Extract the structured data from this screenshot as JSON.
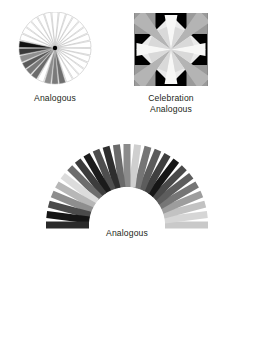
{
  "page": {
    "background": "#ffffff",
    "width": 254,
    "height": 339,
    "text_color": "#231f20"
  },
  "figures": [
    {
      "id": "color-wheel",
      "kind": "radial-wedge-wheel",
      "caption_lines": [
        "Analogous"
      ],
      "center": {
        "x": 37,
        "y": 36
      },
      "radius": 36,
      "hub_color": "#000000",
      "hub_radius": 2.2,
      "outline_color": "#b5b5b5",
      "wedge_count": 30,
      "wedges": [
        {
          "index": 0,
          "angle_deg": 0,
          "fill": "#ffffff"
        },
        {
          "index": 1,
          "angle_deg": 12,
          "fill": "#ffffff"
        },
        {
          "index": 2,
          "angle_deg": 24,
          "fill": "#ffffff"
        },
        {
          "index": 3,
          "angle_deg": 36,
          "fill": "#ffffff"
        },
        {
          "index": 4,
          "angle_deg": 48,
          "fill": "#ffffff"
        },
        {
          "index": 5,
          "angle_deg": 60,
          "fill": "#ffffff"
        },
        {
          "index": 6,
          "angle_deg": 72,
          "fill": "#ffffff"
        },
        {
          "index": 7,
          "angle_deg": 84,
          "fill": "#ffffff"
        },
        {
          "index": 8,
          "angle_deg": 96,
          "fill": "#ffffff"
        },
        {
          "index": 9,
          "angle_deg": 108,
          "fill": "#ffffff"
        },
        {
          "index": 10,
          "angle_deg": 120,
          "fill": "#ffffff"
        },
        {
          "index": 11,
          "angle_deg": 132,
          "fill": "#ffffff"
        },
        {
          "index": 12,
          "angle_deg": 144,
          "fill": "#ffffff"
        },
        {
          "index": 13,
          "angle_deg": 156,
          "fill": "#ffffff"
        },
        {
          "index": 14,
          "angle_deg": 168,
          "fill": "#6e6e6e"
        },
        {
          "index": 15,
          "angle_deg": 180,
          "fill": "#7a7a7a"
        },
        {
          "index": 16,
          "angle_deg": 192,
          "fill": "#8c8c8c"
        },
        {
          "index": 17,
          "angle_deg": 204,
          "fill": "#ffffff"
        },
        {
          "index": 18,
          "angle_deg": 216,
          "fill": "#6b6b6b"
        },
        {
          "index": 19,
          "angle_deg": 228,
          "fill": "#787878"
        },
        {
          "index": 20,
          "angle_deg": 240,
          "fill": "#5a5a5a"
        },
        {
          "index": 21,
          "angle_deg": 252,
          "fill": "#8f8f8f"
        },
        {
          "index": 22,
          "angle_deg": 264,
          "fill": "#3a3a3a"
        },
        {
          "index": 23,
          "angle_deg": 276,
          "fill": "#111111"
        },
        {
          "index": 24,
          "angle_deg": 288,
          "fill": "#ffffff"
        },
        {
          "index": 25,
          "angle_deg": 300,
          "fill": "#ffffff"
        },
        {
          "index": 26,
          "angle_deg": 312,
          "fill": "#ffffff"
        },
        {
          "index": 27,
          "angle_deg": 324,
          "fill": "#ffffff"
        },
        {
          "index": 28,
          "angle_deg": 336,
          "fill": "#ffffff"
        },
        {
          "index": 29,
          "angle_deg": 348,
          "fill": "#ffffff"
        }
      ]
    },
    {
      "id": "celebration-block",
      "kind": "quilt-star-block",
      "caption_lines": [
        "Celebration",
        "Analogous"
      ],
      "size": 74,
      "background": "#f0efee",
      "palette": {
        "corner_dark": "#9a9a9a",
        "mid_gray": "#b4b4b4",
        "light_gray": "#d9d9d9",
        "pale": "#eaeaea",
        "white": "#f7f7f6"
      }
    },
    {
      "id": "analogous-fan",
      "kind": "radial-bar-fan",
      "caption_lines": [
        "Analogous"
      ],
      "center": {
        "x": 109,
        "y": 87
      },
      "inner_radius": 38,
      "outer_radius": 81,
      "bar_width": 7.0,
      "bar_count": 25,
      "span_deg": 180,
      "bars": [
        {
          "index": 0,
          "angle_deg": 180,
          "fill": "#c9c9c9"
        },
        {
          "index": 1,
          "angle_deg": 172.5,
          "fill": "#d6d6d6"
        },
        {
          "index": 2,
          "angle_deg": 165,
          "fill": "#c2c2c2"
        },
        {
          "index": 3,
          "angle_deg": 157.5,
          "fill": "#9d9d9d"
        },
        {
          "index": 4,
          "angle_deg": 150,
          "fill": "#767676"
        },
        {
          "index": 5,
          "angle_deg": 142.5,
          "fill": "#5d5d5d"
        },
        {
          "index": 6,
          "angle_deg": 135,
          "fill": "#4a4a4a"
        },
        {
          "index": 7,
          "angle_deg": 127.5,
          "fill": "#161616"
        },
        {
          "index": 8,
          "angle_deg": 120,
          "fill": "#3f3f3f"
        },
        {
          "index": 9,
          "angle_deg": 112.5,
          "fill": "#5c5c5c"
        },
        {
          "index": 10,
          "angle_deg": 105,
          "fill": "#757575"
        },
        {
          "index": 11,
          "angle_deg": 97.5,
          "fill": "#cfcfcf"
        },
        {
          "index": 12,
          "angle_deg": 90,
          "fill": "#8b8b8b"
        },
        {
          "index": 13,
          "angle_deg": 82.5,
          "fill": "#6a6a6a"
        },
        {
          "index": 14,
          "angle_deg": 75,
          "fill": "#2e2e2e"
        },
        {
          "index": 15,
          "angle_deg": 67.5,
          "fill": "#4e4e4e"
        },
        {
          "index": 16,
          "angle_deg": 60,
          "fill": "#1b1b1b"
        },
        {
          "index": 17,
          "angle_deg": 52.5,
          "fill": "#3c3c3c"
        },
        {
          "index": 18,
          "angle_deg": 45,
          "fill": "#6d6d6d"
        },
        {
          "index": 19,
          "angle_deg": 37.5,
          "fill": "#dcdcdc"
        },
        {
          "index": 20,
          "angle_deg": 30,
          "fill": "#b7b7b7"
        },
        {
          "index": 21,
          "angle_deg": 22.5,
          "fill": "#8e8e8e"
        },
        {
          "index": 22,
          "angle_deg": 15,
          "fill": "#4b4b4b"
        },
        {
          "index": 23,
          "angle_deg": 7.5,
          "fill": "#151515"
        },
        {
          "index": 24,
          "angle_deg": 0,
          "fill": "#2a2a2a"
        }
      ]
    }
  ],
  "captions": {
    "wheel": {
      "line1": "Analogous"
    },
    "square": {
      "line1": "Celebration",
      "line2": "Analogous"
    },
    "fan": {
      "line1": "Analogous"
    }
  }
}
